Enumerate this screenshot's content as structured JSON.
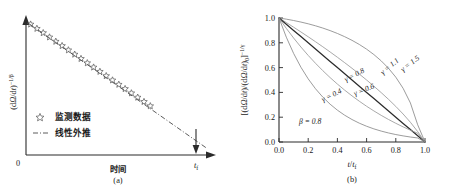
{
  "figure": {
    "background_color": "#ffffff",
    "text_color": "#1a1a1a",
    "panels": [
      {
        "id": "a",
        "caption": "(a)"
      },
      {
        "id": "b",
        "caption": "(b)"
      }
    ]
  },
  "panel_a": {
    "caption": "(a)",
    "x_axis_label": "时间",
    "y_axis_label_parts": {
      "open_paren": "(d",
      "omega": "Ω",
      "slash": "/d",
      "t": "t",
      "close_paren": ")",
      "exponent": "−1/β"
    },
    "y_axis_label_plain": "(dΩ/dt)^(−1/β)",
    "origin_label": "0",
    "end_label_base": "t",
    "end_label_sub": "f",
    "end_label_plain": "t_f",
    "legend": {
      "items": [
        {
          "marker": "star-open-marker",
          "label": "监测数据"
        },
        {
          "marker": "dash-dot-line-marker",
          "label": "线性外推"
        }
      ]
    },
    "arrow_annotation": "down-arrow-to-tf"
  },
  "panel_b": {
    "caption": "(b)",
    "x_axis_label_parts": {
      "t": "t",
      "slash": "/",
      "t2": "t",
      "sub": "f"
    },
    "x_axis_label_plain": "t/t_f",
    "y_axis_label_plain": "[(dΩ/dt)/(dΩ/dt)_0]^(−1/γ)",
    "y_axis_label_parts": {
      "open_bracket": "[(d",
      "omega": "Ω",
      "mid": "/d",
      "t": "t",
      "ratio": ")/(d",
      "omega2": "Ω",
      "mid2": "/d",
      "t2": "t",
      "close": ")",
      "sub0": "0",
      "close_bracket": "]",
      "exponent": "−1/γ"
    },
    "annotation": {
      "symbol": "β",
      "equals": " = ",
      "value": "0.8",
      "plain": "β = 0.8"
    },
    "curve_labels": [
      {
        "text": "γ = 1.5",
        "gamma": 1.5
      },
      {
        "text": "γ = 1.1",
        "gamma": 1.1
      },
      {
        "text": "γ = 0.8",
        "gamma": 0.8
      },
      {
        "text": "γ = 0.6",
        "gamma": 0.6
      },
      {
        "text": "γ = 0.4",
        "gamma": 0.4
      }
    ]
  },
  "chart_data": [
    {
      "type": "scatter",
      "panel": "a",
      "title": "",
      "xlabel": "时间",
      "ylabel": "(dΩ/dt)^(−1/β)",
      "xlim": [
        0,
        1
      ],
      "ylim": [
        0,
        1
      ],
      "grid": false,
      "axis_ticks_shown": false,
      "x_tick_labels": [
        "0",
        "t_f"
      ],
      "y_tick_labels": [],
      "legend": [
        "监测数据",
        "线性外推"
      ],
      "legend_position": "lower-left",
      "series": [
        {
          "name": "监测数据",
          "style": "open-star-markers",
          "color": "#555555",
          "x": [
            0.02,
            0.055,
            0.09,
            0.125,
            0.16,
            0.195,
            0.23,
            0.265,
            0.3,
            0.335,
            0.37,
            0.405,
            0.44,
            0.475,
            0.51,
            0.545,
            0.58,
            0.615,
            0.65,
            0.685,
            0.72
          ],
          "y": [
            0.975,
            0.943,
            0.911,
            0.879,
            0.847,
            0.815,
            0.783,
            0.751,
            0.719,
            0.687,
            0.655,
            0.623,
            0.591,
            0.559,
            0.527,
            0.495,
            0.463,
            0.431,
            0.399,
            0.367,
            0.335
          ]
        },
        {
          "name": "线性外推",
          "style": "dash-dot-line",
          "color": "#4a4a4a",
          "x": [
            0.02,
            1.0
          ],
          "y": [
            0.975,
            0.06
          ]
        }
      ]
    },
    {
      "type": "line",
      "panel": "b",
      "title": "",
      "xlabel": "t/t_f",
      "ylabel": "[(dΩ/dt)/(dΩ/dt)_0]^(−1/γ)",
      "xlim": [
        0.0,
        1.0
      ],
      "ylim": [
        0.0,
        1.0
      ],
      "x_ticks": [
        0.0,
        0.2,
        0.4,
        0.6,
        0.8,
        1.0
      ],
      "y_ticks": [
        0.0,
        0.2,
        0.4,
        0.6,
        0.8,
        1.0
      ],
      "x_tick_labels": [
        "0.0",
        "0.2",
        "0.4",
        "0.6",
        "0.8",
        "1.0"
      ],
      "y_tick_labels": [
        "0.0",
        "0.2",
        "0.4",
        "0.6",
        "0.8",
        "1.0"
      ],
      "grid": false,
      "legend_position": "inline-curve-labels",
      "annotations": [
        {
          "text": "β = 0.8",
          "x": 0.17,
          "y": 0.21
        }
      ],
      "x": [
        0.0,
        0.05,
        0.1,
        0.15,
        0.2,
        0.25,
        0.3,
        0.35,
        0.4,
        0.45,
        0.5,
        0.55,
        0.6,
        0.65,
        0.7,
        0.75,
        0.8,
        0.85,
        0.9,
        0.95,
        1.0
      ],
      "series": [
        {
          "name": "γ = 1.5",
          "gamma": 1.5,
          "color": "#8a8a8a",
          "values": [
            1.0,
            0.9907,
            0.9798,
            0.9673,
            0.9532,
            0.9371,
            0.9189,
            0.8984,
            0.8753,
            0.8493,
            0.8199,
            0.7866,
            0.7486,
            0.705,
            0.6543,
            0.5946,
            0.5227,
            0.4331,
            0.315,
            0.1387,
            0.0
          ]
        },
        {
          "name": "γ = 1.1",
          "gamma": 1.1,
          "color": "#9a9a9a",
          "values": [
            1.0,
            0.9633,
            0.9258,
            0.8876,
            0.8486,
            0.8087,
            0.7679,
            0.7262,
            0.6834,
            0.6395,
            0.5944,
            0.5479,
            0.4999,
            0.4501,
            0.3983,
            0.3441,
            0.2869,
            0.2258,
            0.1592,
            0.0837,
            0.0
          ]
        },
        {
          "name": "γ = 0.8",
          "gamma": 0.8,
          "color": "#2b2b2b",
          "values": [
            1.0,
            0.95,
            0.9,
            0.85,
            0.8,
            0.75,
            0.7,
            0.65,
            0.6,
            0.55,
            0.5,
            0.45,
            0.4,
            0.35,
            0.3,
            0.25,
            0.2,
            0.15,
            0.1,
            0.05,
            0.0
          ]
        },
        {
          "name": "γ = 0.6",
          "gamma": 0.6,
          "color": "#9a9a9a",
          "values": [
            1.0,
            0.9164,
            0.8387,
            0.7661,
            0.6983,
            0.6348,
            0.5753,
            0.5195,
            0.4672,
            0.4181,
            0.372,
            0.3288,
            0.2883,
            0.2504,
            0.2149,
            0.1817,
            0.1508,
            0.122,
            0.0953,
            0.0706,
            0.0
          ]
        },
        {
          "name": "γ = 0.4",
          "gamma": 0.4,
          "color": "#8a8a8a",
          "values": [
            1.0,
            0.8456,
            0.7145,
            0.6033,
            0.5091,
            0.4294,
            0.362,
            0.305,
            0.2568,
            0.2159,
            0.1812,
            0.1518,
            0.1269,
            0.1058,
            0.088,
            0.0729,
            0.0601,
            0.0493,
            0.0402,
            0.0325,
            0.0
          ]
        }
      ]
    }
  ]
}
